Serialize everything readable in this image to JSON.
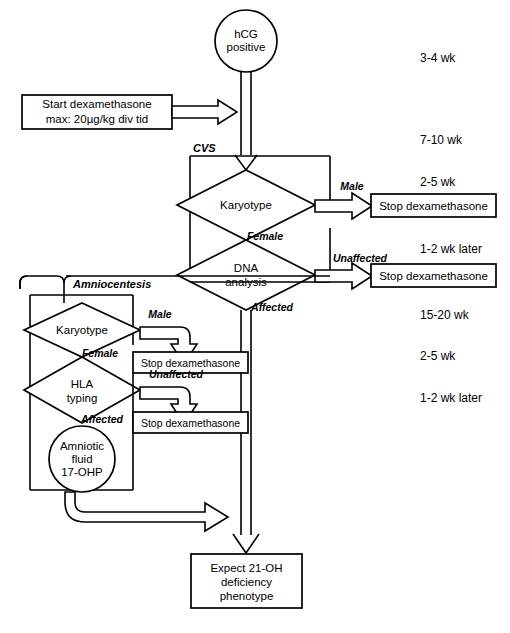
{
  "diagram": {
    "type": "flowchart",
    "background_color": "#ffffff",
    "line_color": "#000000"
  },
  "nodes": {
    "start": {
      "id": "hcg",
      "shape": "circle",
      "line1": "hCG",
      "line2": "positive"
    },
    "treatment": {
      "id": "start-dexamethasone",
      "shape": "rect",
      "line1": "Start dexamethasone",
      "line2": "max: 20µg/kg div tid"
    },
    "cvs_karyotype": {
      "id": "cvs-karyotype",
      "shape": "diamond",
      "label": "Karyotype"
    },
    "dna_analysis": {
      "id": "dna-analysis",
      "shape": "diamond",
      "line1": "DNA",
      "line2": "analysis"
    },
    "amnio_karyotype": {
      "id": "amnio-karyotype",
      "shape": "diamond",
      "label": "Karyotype"
    },
    "hla_typing": {
      "id": "hla-typing",
      "shape": "diamond",
      "line1": "HLA",
      "line2": "typing"
    },
    "amniotic_fluid": {
      "id": "amniotic-fluid",
      "shape": "circle",
      "line1": "Amniotic",
      "line2": "fluid",
      "line3": "17-OHP"
    },
    "outcome": {
      "id": "expect-phenotype",
      "shape": "rect",
      "line1": "Expect 21-OH",
      "line2": "deficiency",
      "line3": "phenotype"
    }
  },
  "stop_boxes": [
    {
      "id": "stop-cvs-male",
      "label": "Stop dexamethasone"
    },
    {
      "id": "stop-cvs-unaffected",
      "label": "Stop dexamethasone"
    },
    {
      "id": "stop-amnio-male",
      "label": "Stop dexamethasone"
    },
    {
      "id": "stop-amnio-unaffected",
      "label": "Stop dexamethasone"
    }
  ],
  "section_labels": {
    "cvs": "CVS",
    "amniocentesis": "Amniocentesis"
  },
  "edge_labels": {
    "cvs_male": "Male",
    "cvs_female": "Female",
    "dna_unaffected": "Unaffected",
    "dna_affected": "Affected",
    "amnio_male": "Male",
    "amnio_female": "Female",
    "hla_unaffected": "Unaffected",
    "hla_affected": "Affected"
  },
  "timeline": [
    {
      "id": "t1",
      "label": "3-4 wk",
      "y": 62
    },
    {
      "id": "t2",
      "label": "7-10 wk",
      "y": 144
    },
    {
      "id": "t3",
      "label": "2-5 wk",
      "y": 186
    },
    {
      "id": "t4",
      "label": "1-2 wk later",
      "y": 253
    },
    {
      "id": "t5",
      "label": "15-20 wk",
      "y": 319
    },
    {
      "id": "t6",
      "label": "2-5 wk",
      "y": 360
    },
    {
      "id": "t7",
      "label": "1-2 wk later",
      "y": 402
    }
  ]
}
